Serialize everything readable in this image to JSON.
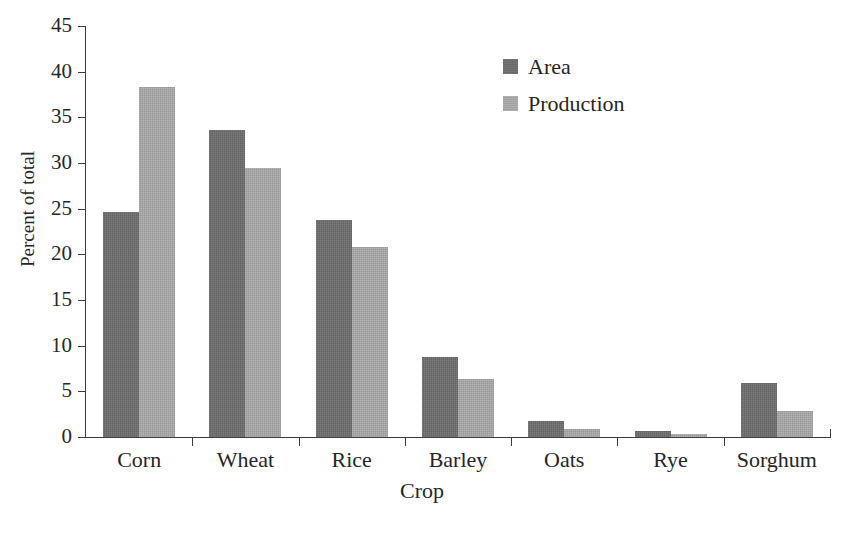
{
  "chart_data": {
    "type": "bar",
    "title": "",
    "xlabel": "Crop",
    "ylabel": "Percent of total",
    "categories": [
      "Corn",
      "Wheat",
      "Rice",
      "Barley",
      "Oats",
      "Rye",
      "Sorghum"
    ],
    "series": [
      {
        "name": "Area",
        "color": "#6e6e6e",
        "values": [
          24.6,
          33.6,
          23.8,
          8.8,
          1.8,
          0.7,
          5.9
        ]
      },
      {
        "name": "Production",
        "color": "#a9a9a9",
        "values": [
          38.3,
          29.4,
          20.8,
          6.3,
          0.9,
          0.35,
          2.9
        ]
      }
    ],
    "ylim": [
      0,
      45
    ],
    "ytick_step": 5,
    "yticks": [
      0,
      5,
      10,
      15,
      20,
      25,
      30,
      35,
      40,
      45
    ],
    "ytick_labels": [
      "0",
      "5",
      "10",
      "15",
      "20",
      "25",
      "30",
      "35",
      "40",
      "45"
    ],
    "grid": false,
    "legend_position": "top-center-right",
    "axis_color": "#3c3c3c"
  }
}
